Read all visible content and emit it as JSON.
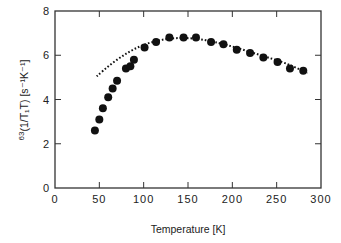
{
  "chart_data": {
    "type": "scatter",
    "title": "",
    "xlabel": "Temperature  [K]",
    "ylabel_prefix": "63",
    "ylabel": "(1/T₁T)  [s⁻¹K⁻¹]",
    "xlim": [
      0,
      300
    ],
    "ylim": [
      0,
      8
    ],
    "x_ticks": [
      0,
      50,
      100,
      150,
      200,
      250,
      300
    ],
    "y_ticks": [
      0,
      2,
      4,
      6,
      8
    ],
    "grid": false,
    "legend": null,
    "series": [
      {
        "name": "measured",
        "style": "filled-circle",
        "x": [
          45,
          50,
          54,
          60,
          65,
          70,
          80,
          85,
          89,
          101,
          114,
          129,
          145,
          159,
          176,
          190,
          205,
          220,
          235,
          251,
          265,
          280
        ],
        "y": [
          2.6,
          3.1,
          3.6,
          4.1,
          4.5,
          4.85,
          5.4,
          5.5,
          5.8,
          6.35,
          6.6,
          6.8,
          6.8,
          6.8,
          6.6,
          6.5,
          6.25,
          6.1,
          5.9,
          5.7,
          5.4,
          5.3
        ]
      },
      {
        "name": "fit",
        "style": "dotted-line",
        "x": [
          47,
          60,
          75,
          90,
          105,
          120,
          135,
          150,
          165,
          180,
          200,
          220,
          240,
          260,
          285
        ],
        "y": [
          5.05,
          5.5,
          5.95,
          6.3,
          6.55,
          6.7,
          6.78,
          6.78,
          6.72,
          6.6,
          6.4,
          6.15,
          5.9,
          5.65,
          5.2
        ]
      }
    ]
  }
}
